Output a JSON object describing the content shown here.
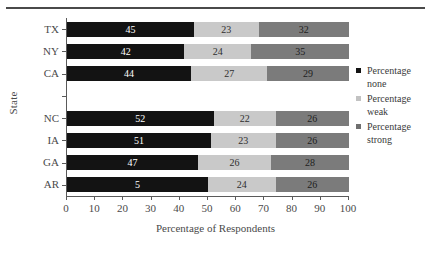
{
  "chart_data": {
    "type": "bar",
    "orientation": "horizontal",
    "stacked": true,
    "title": "",
    "xlabel": "Percentage of Respondents",
    "ylabel": "State",
    "xlim": [
      0,
      100
    ],
    "xticks": [
      0,
      10,
      20,
      30,
      40,
      50,
      60,
      70,
      80,
      90,
      100
    ],
    "grid": false,
    "legend_position": "right",
    "categories": [
      "TX",
      "NY",
      "CA",
      "",
      "NC",
      "IA",
      "GA",
      "AR"
    ],
    "series": [
      {
        "name": "Percentage none",
        "color": "#131313",
        "values": [
          45,
          42,
          44,
          null,
          52,
          51,
          47,
          50
        ],
        "labels": [
          "45",
          "42",
          "44",
          "",
          "52",
          "51",
          "47",
          "5"
        ]
      },
      {
        "name": "Percentage weak",
        "color": "#c9c9c9",
        "values": [
          23,
          24,
          27,
          null,
          22,
          23,
          26,
          24
        ],
        "labels": [
          "23",
          "24",
          "27",
          "",
          "22",
          "23",
          "26",
          "24"
        ]
      },
      {
        "name": "Percentage strong",
        "color": "#7b7b7b",
        "values": [
          32,
          35,
          29,
          null,
          26,
          26,
          28,
          26
        ],
        "labels": [
          "32",
          "35",
          "29",
          "",
          "26",
          "26",
          "28",
          "26"
        ]
      }
    ]
  },
  "legend": {
    "items": [
      {
        "line1": "Percentage",
        "line2": "none",
        "swatch": "none"
      },
      {
        "line1": "Percentage",
        "line2": "weak",
        "swatch": "weak"
      },
      {
        "line1": "Percentage",
        "line2": "strong",
        "swatch": "strong"
      }
    ]
  },
  "axes": {
    "x_title": "Percentage of Respondents",
    "y_title": "State"
  }
}
